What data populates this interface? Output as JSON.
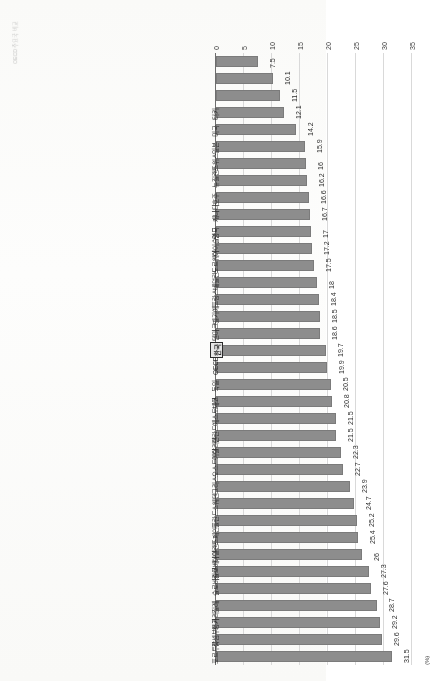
{
  "page": {
    "caption": "OECD 주요국 비교"
  },
  "chart_data": {
    "type": "bar",
    "orientation": "horizontal",
    "title": "",
    "xlabel": "",
    "ylabel": "",
    "unit_label": "(%)",
    "xlim": [
      0,
      35
    ],
    "ticks": [
      0,
      5,
      10,
      15,
      20,
      25,
      30,
      35
    ],
    "grid": true,
    "legend": "none",
    "bar_color": "#8d8d8d",
    "highlight_index": 18,
    "categories": [
      "포르투갈",
      "룩셈부르크",
      "헝가리",
      "칠레",
      "슬로바키아",
      "슬로베니아",
      "아일랜드",
      "스페인",
      "폴란드",
      "스웨덴",
      "그리스",
      "오스트리아",
      "이탈리아",
      "핀란드",
      "에스토니아",
      "체코",
      "독일",
      "OECD 평균",
      "한국",
      "덴마크",
      "벨기에",
      "프랑스",
      "네덜란드",
      "노르웨이",
      "아이슬란드",
      "영국",
      "캐나다",
      "호주",
      "뉴질랜드",
      "스위스",
      "일본",
      "미국",
      "터키"
    ],
    "values": [
      31.5,
      29.6,
      29.2,
      28.7,
      27.6,
      27.3,
      26,
      25.4,
      25.2,
      24.7,
      23.9,
      22.7,
      22.3,
      21.5,
      21.5,
      20.8,
      20.5,
      19.9,
      19.7,
      18.6,
      18.5,
      18.4,
      18,
      17.5,
      17.2,
      17,
      16.7,
      16.6,
      16.2,
      16,
      15.9,
      14.2,
      12.1
    ],
    "values_tail": [
      11.5,
      10.1,
      7.5
    ]
  }
}
